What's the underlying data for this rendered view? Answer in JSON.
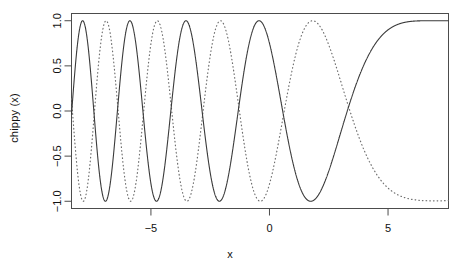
{
  "chart_data": {
    "type": "line",
    "title": "",
    "xlabel": "x",
    "ylabel": "chippy (x)",
    "xlim": [
      -8.35,
      7.55
    ],
    "ylim": [
      -1.08,
      1.08
    ],
    "grid": false,
    "legend": "none",
    "x_ticks": [
      -5,
      0,
      5
    ],
    "x_tick_labels": [
      "-5",
      "0",
      "5"
    ],
    "y_ticks": [
      -1.0,
      -0.5,
      0.0,
      0.5,
      1.0
    ],
    "y_tick_labels": [
      "-1.0",
      "-0.5",
      "0.0",
      "0.5",
      "1.0"
    ],
    "series": [
      {
        "name": "chippy (x)",
        "style": "solid",
        "color": "#3a3a3a",
        "formula": "cos(x^2/3) damped envelope chirp, frequency increasing toward negative x",
        "description": "Solid chirp curve: rapid oscillation between -1.0 and 1.0 at left edge near x=-8, frequency decreasing rightward; local maxima at 1.0 near x=-3.9 and x=-3.1, dip to 0.78 between them; minimum -1.0 near x=-2.2; broad maximum 1.0 near x=-0.6; minimum -0.30 near x=2.9; flattens toward 0.02 at right edge x=7.5"
      },
      {
        "name": "chippy shifted",
        "style": "dotted",
        "color": "#6e6e6e",
        "formula": "phase-shifted chirp, same envelope",
        "description": "Dotted chirp curve lagging the solid one: dense oscillation at far left, maximum 1.0 near x=1.6, minimum -1.0 near x=4.9, rising steeply to 0.88 at right edge x=7.5"
      }
    ],
    "values_note": "Both curves oscillate in [-1, 1]; oscillation frequency grows with |x| toward the left side of the panel"
  },
  "labels": {
    "x_axis": "x",
    "y_axis": "chippy (x)"
  },
  "colors": {
    "frame": "#4c4c4c",
    "solid_curve": "#3a3a3a",
    "dotted_curve": "#6e6e6e",
    "background": "#ffffff",
    "text": "#111111"
  }
}
